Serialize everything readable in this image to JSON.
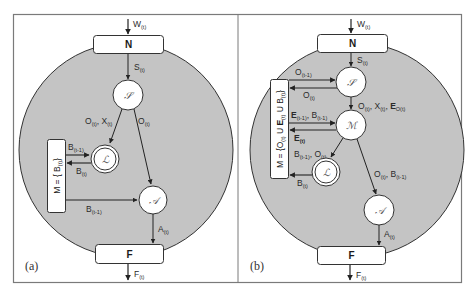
{
  "figure": {
    "frame_color": "#7a7a7a",
    "region_fill": "#c4c4c4",
    "node_fill": "#ffffff",
    "stroke_color": "#333333"
  },
  "panel_a": {
    "label": "(a)",
    "input": {
      "main": "W",
      "sub": "(t)"
    },
    "top_box": "N",
    "bottom_box": "F",
    "output": {
      "main": "F",
      "sub": "(t)"
    },
    "nodes": {
      "S": "𝒮",
      "L": "ℒ",
      "A": "𝒜"
    },
    "memory_box": {
      "main": "M = { B",
      "sub": "(t)",
      "end": "}"
    },
    "edges": {
      "n_to_s": {
        "main": "S",
        "sub": "(t)"
      },
      "s_to_l": {
        "p1": "O",
        "s1": "(t)",
        "p2": ", X",
        "s2": "(t)"
      },
      "s_to_a": {
        "main": "O",
        "sub": "(t)"
      },
      "m_to_l": {
        "main": "B",
        "sub": "(t-1)"
      },
      "l_to_m": {
        "main": "B",
        "sub": "(t)"
      },
      "m_to_a": {
        "main": "B",
        "sub": "(t-1)"
      },
      "a_to_f": {
        "main": "A",
        "sub": "(t)"
      }
    }
  },
  "panel_b": {
    "label": "(b)",
    "input": {
      "main": "W",
      "sub": "(t)"
    },
    "top_box": "N",
    "bottom_box": "F",
    "output": {
      "main": "F",
      "sub": "(t)"
    },
    "nodes": {
      "S": "𝒮",
      "M": "ℳ",
      "L": "ℒ",
      "A": "𝒜"
    },
    "memory_box": {
      "p1": "M = {O",
      "s1": "(t)",
      "p2": " U ",
      "p3": "E",
      "s3": "(t)",
      "p4": " U B",
      "s4": "(t)",
      "end": "}"
    },
    "edges": {
      "n_to_s": {
        "main": "S",
        "sub": "(t)"
      },
      "mem_to_s": {
        "main": "O",
        "sub": "(t-1)"
      },
      "s_to_mem": {
        "main": "O",
        "sub": "(t)"
      },
      "s_to_m": {
        "p1": "O",
        "s1": "(t)",
        "p2": ", X",
        "s2": "(t)",
        "p3": ", ",
        "p4": "E",
        "s4": "O(t)"
      },
      "mem_to_m": {
        "p1": "E",
        "s1": "(t-1)",
        "p2": ", B",
        "s2": "(t-1)"
      },
      "m_to_mem": {
        "main": "E",
        "sub": "(t)"
      },
      "m_to_l": {
        "p1": "B",
        "s1": "(t-1)",
        "p2": ", O",
        "s2": "(t)"
      },
      "l_to_mem": {
        "main": "B",
        "sub": "(t)"
      },
      "m_to_a": {
        "p1": "O",
        "s1": "(t)",
        "p2": ", B",
        "s2": "(t-1)"
      },
      "a_to_f": {
        "main": "A",
        "sub": "(t)"
      }
    }
  }
}
